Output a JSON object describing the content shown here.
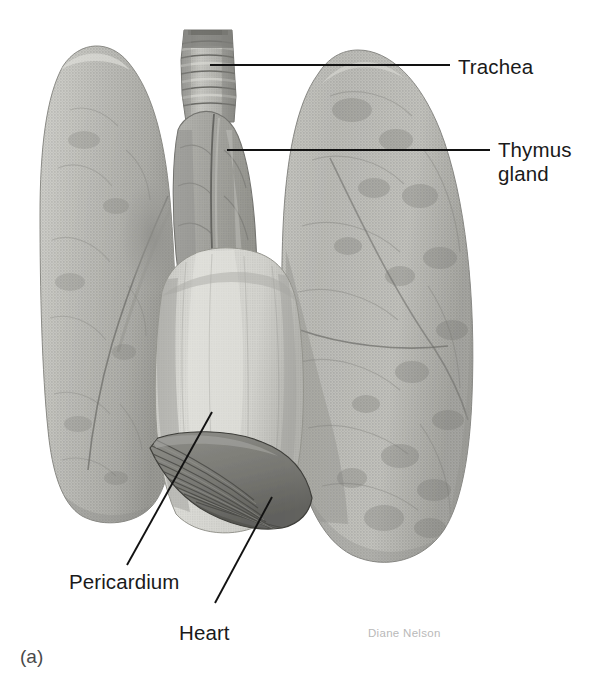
{
  "figure": {
    "panel_letter": "(a)",
    "artist_credit": "Diane Nelson",
    "background_color": "#ffffff",
    "ink_color": "#121212"
  },
  "labels": [
    {
      "id": "trachea",
      "text": "Trachea",
      "text_x": 458,
      "text_y": 74,
      "leader": "M210,65 L450,65",
      "icon": "leader-line-horizontal"
    },
    {
      "id": "thymus-gland",
      "text": "Thymus",
      "text2": "gland",
      "text_x": 498,
      "text_y": 157,
      "text2_y": 181,
      "leader": "M227,150 L490,150",
      "icon": "leader-line-horizontal"
    },
    {
      "id": "pericardium",
      "text": "Pericardium",
      "text_x": 69,
      "text_y": 589,
      "leader": "M212,412 L127,565",
      "icon": "leader-line-diagonal"
    },
    {
      "id": "heart",
      "text": "Heart",
      "text_x": 179,
      "text_y": 640,
      "leader": "M272,497 L215,603",
      "icon": "leader-line-diagonal"
    }
  ],
  "structures": [
    {
      "id": "left-lung",
      "name": "left lung",
      "tone": "#b5b5b0"
    },
    {
      "id": "right-lung",
      "name": "right lung",
      "tone": "#b8b8b3"
    },
    {
      "id": "trachea-tube",
      "name": "trachea",
      "tone": "#a9a9a4"
    },
    {
      "id": "thymus-lobes",
      "name": "thymus gland",
      "tone": "#a5a5a0"
    },
    {
      "id": "pericardial-sac",
      "name": "pericardium",
      "tone": "#cfcfca"
    },
    {
      "id": "diaphragm-muscle",
      "name": "diaphragm",
      "tone": "#7e7e79"
    }
  ],
  "palette": {
    "lung_light": "#c9c9c4",
    "lung_mid": "#b2b2ad",
    "lung_dark": "#949490",
    "pericardium_light": "#d8d8d3",
    "pericardium_shadow": "#b0b0ab",
    "diaphragm": "#82827d",
    "diaphragm_dark": "#63635f",
    "outline": "#3a3a37"
  }
}
